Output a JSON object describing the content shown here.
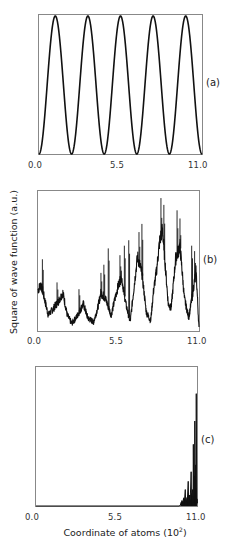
{
  "figure": {
    "ylabel": "Square of wave function (a.u.)",
    "xlabel_main": "Coordinate of atoms (10",
    "xlabel_exp": "2",
    "xlabel_close": ")",
    "xticks": [
      "0.0",
      "5.5",
      "11.0"
    ],
    "panels": [
      {
        "id": "a",
        "label": "(a)"
      },
      {
        "id": "b",
        "label": "(b)"
      },
      {
        "id": "c",
        "label": "(c)"
      }
    ],
    "line_color": "#111111",
    "frame_color": "#888888"
  },
  "chart_data": [
    {
      "type": "line",
      "panel": "(a)",
      "title": "",
      "xlabel": "",
      "ylabel": "Square of wave function (a.u.)",
      "xlim": [
        0.0,
        11.0
      ],
      "xticks": [
        0.0,
        5.5,
        11.0
      ],
      "ylim": [
        0,
        1
      ],
      "description": "Extended periodic state: sin^2 with 5 full periods across the chain",
      "x": [
        0.0,
        0.55,
        1.1,
        1.65,
        2.2,
        2.75,
        3.3,
        3.85,
        4.4,
        4.95,
        5.5,
        6.05,
        6.6,
        7.15,
        7.7,
        8.25,
        8.8,
        9.35,
        9.9,
        10.45,
        11.0
      ],
      "y": [
        0.0,
        0.65,
        1.0,
        0.65,
        0.0,
        0.65,
        1.0,
        0.65,
        0.0,
        0.65,
        1.0,
        0.65,
        0.0,
        0.65,
        1.0,
        0.65,
        0.0,
        0.65,
        1.0,
        0.65,
        0.0
      ],
      "peaks_x": [
        1.1,
        3.3,
        5.5,
        7.7,
        9.9
      ],
      "minima_x": [
        0.0,
        2.2,
        4.4,
        6.6,
        8.8,
        11.0
      ]
    },
    {
      "type": "line",
      "panel": "(b)",
      "title": "",
      "xlabel": "",
      "ylabel": "Square of wave function (a.u.)",
      "xlim": [
        0.0,
        11.0
      ],
      "xticks": [
        0.0,
        5.5,
        11.0
      ],
      "ylim": [
        0,
        1
      ],
      "description": "Critical (self-similar, fractal-like) state with noisy spiky envelope growing toward right",
      "envelope_x": [
        0.0,
        0.2,
        0.35,
        0.7,
        1.0,
        1.4,
        1.7,
        2.0,
        2.3,
        2.6,
        2.9,
        3.1,
        3.4,
        3.8,
        4.1,
        4.3,
        4.6,
        5.0,
        5.4,
        5.7,
        6.0,
        6.3,
        6.6,
        6.8,
        7.1,
        7.4,
        7.7,
        7.9,
        8.1,
        8.3,
        8.5,
        8.7,
        8.9,
        9.1,
        9.4,
        9.7,
        10.0,
        10.3,
        10.6,
        10.8,
        11.0
      ],
      "envelope_y": [
        0.28,
        0.32,
        0.26,
        0.1,
        0.14,
        0.2,
        0.26,
        0.1,
        0.04,
        0.08,
        0.14,
        0.18,
        0.08,
        0.05,
        0.16,
        0.26,
        0.22,
        0.1,
        0.28,
        0.38,
        0.18,
        0.05,
        0.34,
        0.52,
        0.4,
        0.12,
        0.06,
        0.28,
        0.42,
        0.62,
        0.72,
        0.45,
        0.18,
        0.15,
        0.5,
        0.6,
        0.22,
        0.08,
        0.28,
        0.42,
        0.0
      ],
      "spikes": [
        {
          "x": 0.3,
          "y": 0.52
        },
        {
          "x": 1.3,
          "y": 0.35
        },
        {
          "x": 2.8,
          "y": 0.3
        },
        {
          "x": 4.3,
          "y": 0.42
        },
        {
          "x": 4.5,
          "y": 0.48
        },
        {
          "x": 4.8,
          "y": 0.6
        },
        {
          "x": 5.6,
          "y": 0.55
        },
        {
          "x": 5.9,
          "y": 0.62
        },
        {
          "x": 6.2,
          "y": 0.66
        },
        {
          "x": 6.9,
          "y": 0.72
        },
        {
          "x": 7.1,
          "y": 0.78
        },
        {
          "x": 8.4,
          "y": 0.97
        },
        {
          "x": 8.6,
          "y": 0.92
        },
        {
          "x": 9.5,
          "y": 0.88
        },
        {
          "x": 9.7,
          "y": 0.82
        },
        {
          "x": 10.5,
          "y": 0.62
        },
        {
          "x": 10.7,
          "y": 0.58
        }
      ]
    },
    {
      "type": "line",
      "panel": "(c)",
      "title": "",
      "xlabel": "Coordinate of atoms (10^2)",
      "ylabel": "Square of wave function (a.u.)",
      "xlim": [
        0.0,
        11.0
      ],
      "xticks": [
        0.0,
        5.5,
        11.0
      ],
      "ylim": [
        0,
        1
      ],
      "description": "Localized state: near-zero everywhere except sharp spikes concentrated near x≈10-11",
      "x": [
        0.0,
        9.8,
        10.0,
        10.1,
        10.2,
        10.3,
        10.4,
        10.5,
        10.6,
        10.7,
        10.75,
        10.8,
        10.85,
        10.9,
        10.95,
        11.0
      ],
      "y": [
        0.0,
        0.0,
        0.03,
        0.06,
        0.12,
        0.04,
        0.18,
        0.08,
        0.25,
        0.12,
        0.45,
        0.22,
        0.62,
        0.3,
        0.82,
        0.05
      ]
    }
  ]
}
